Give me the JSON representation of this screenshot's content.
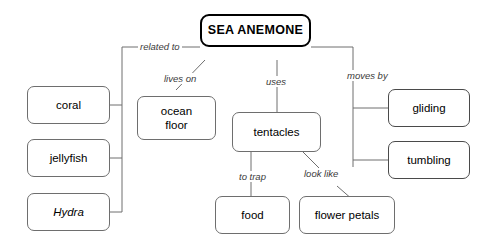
{
  "diagram": {
    "title": "SEA ANEMONE",
    "root": {
      "label": "SEA ANEMONE"
    },
    "nodes": {
      "coral": "coral",
      "jellyfish": "jellyfish",
      "hydra": "Hydra",
      "ocean_floor": "ocean\nfloor",
      "ocean_floor_line1": "ocean",
      "ocean_floor_line2": "floor",
      "tentacles": "tentacles",
      "food": "food",
      "flower_petals": "flower petals",
      "gliding": "gliding",
      "tumbling": "tumbling"
    },
    "edge_labels": {
      "related_to": "related to",
      "lives_on": "lives on",
      "uses": "uses",
      "moves_by": "moves by",
      "to_trap": "to trap",
      "look_like": "look like"
    },
    "colors": {
      "background": "#ffffff",
      "box_border": "#6e6e6e",
      "root_border": "#000000",
      "connector": "#6e6e6e",
      "text": "#000000",
      "label_text": "#3a3a3a"
    }
  }
}
